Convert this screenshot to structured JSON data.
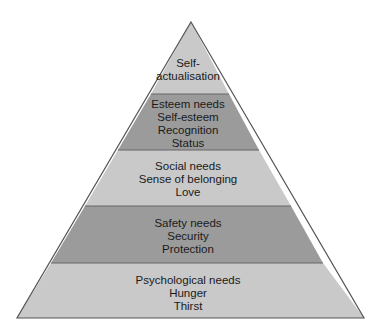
{
  "diagram": {
    "type": "pyramid",
    "colors": {
      "light": "#c9c9c9",
      "dark": "#9b9b9b",
      "outline": "#555555"
    },
    "levels": [
      {
        "name": "self-actualisation",
        "lines": [
          "Self-",
          "actualisation"
        ],
        "shade": "light"
      },
      {
        "name": "esteem",
        "lines": [
          "Esteem needs",
          "Self-esteem",
          "Recognition",
          "Status"
        ],
        "shade": "dark"
      },
      {
        "name": "social",
        "lines": [
          "Social needs",
          "Sense of belonging",
          "Love"
        ],
        "shade": "light"
      },
      {
        "name": "safety",
        "lines": [
          "Safety needs",
          "Security",
          "Protection"
        ],
        "shade": "dark"
      },
      {
        "name": "psychological",
        "lines": [
          "Psychological needs",
          "Hunger",
          "Thirst"
        ],
        "shade": "light"
      }
    ]
  }
}
